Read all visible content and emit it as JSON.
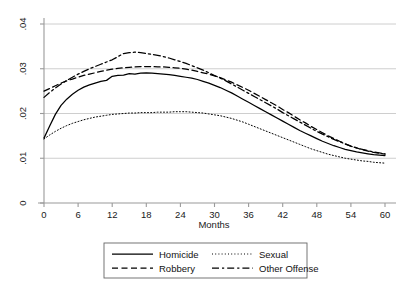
{
  "chart_data": {
    "type": "line",
    "title": "",
    "xlabel": "Months",
    "ylabel": "",
    "xlim": [
      0,
      60
    ],
    "ylim": [
      0,
      0.04
    ],
    "xticks": [
      0,
      6,
      12,
      18,
      24,
      30,
      36,
      42,
      48,
      54,
      60
    ],
    "xtick_labels": [
      "0",
      "6",
      "12",
      "18",
      "24",
      "30",
      "36",
      "42",
      "48",
      "54",
      "60"
    ],
    "yticks": [
      0,
      0.01,
      0.02,
      0.03,
      0.04
    ],
    "ytick_labels": [
      "0",
      ".01",
      ".02",
      ".03",
      ".04"
    ],
    "grid": "horizontal",
    "legend_position": "below-center",
    "x": [
      0,
      1,
      2,
      3,
      4,
      5,
      6,
      7,
      8,
      9,
      10,
      11,
      12,
      13,
      14,
      15,
      16,
      17,
      18,
      19,
      20,
      21,
      22,
      23,
      24,
      25,
      26,
      27,
      28,
      29,
      30,
      31,
      32,
      33,
      34,
      35,
      36,
      37,
      38,
      39,
      40,
      41,
      42,
      43,
      44,
      45,
      46,
      47,
      48,
      49,
      50,
      51,
      52,
      53,
      54,
      55,
      56,
      57,
      58,
      59,
      60
    ],
    "series": [
      {
        "name": "Homicide",
        "style": "solid",
        "values": [
          0.0145,
          0.0172,
          0.0198,
          0.0218,
          0.0232,
          0.0243,
          0.0252,
          0.0259,
          0.0264,
          0.0268,
          0.0272,
          0.0274,
          0.0283,
          0.0285,
          0.0286,
          0.0289,
          0.0288,
          0.029,
          0.0291,
          0.029,
          0.0289,
          0.0288,
          0.0287,
          0.0285,
          0.0283,
          0.0281,
          0.0279,
          0.0276,
          0.0272,
          0.0268,
          0.0263,
          0.0258,
          0.0252,
          0.0246,
          0.0239,
          0.0232,
          0.0225,
          0.0218,
          0.0211,
          0.0204,
          0.0197,
          0.019,
          0.0183,
          0.0176,
          0.0169,
          0.0162,
          0.0156,
          0.015,
          0.0144,
          0.0138,
          0.0133,
          0.0128,
          0.0124,
          0.012,
          0.0117,
          0.0114,
          0.0112,
          0.011,
          0.0108,
          0.0107,
          0.0106
        ]
      },
      {
        "name": "Robbery",
        "style": "dashed",
        "values": [
          0.025,
          0.0256,
          0.0262,
          0.0268,
          0.0273,
          0.0277,
          0.0281,
          0.0285,
          0.0288,
          0.0291,
          0.0294,
          0.0297,
          0.0299,
          0.0301,
          0.0302,
          0.0303,
          0.0304,
          0.0305,
          0.0305,
          0.0305,
          0.0304,
          0.0304,
          0.0303,
          0.0302,
          0.0301,
          0.0299,
          0.0297,
          0.0294,
          0.0291,
          0.0288,
          0.0284,
          0.028,
          0.0275,
          0.027,
          0.0264,
          0.0258,
          0.0252,
          0.0245,
          0.0238,
          0.0231,
          0.0224,
          0.0217,
          0.0209,
          0.0202,
          0.0194,
          0.0186,
          0.0179,
          0.0171,
          0.0164,
          0.0157,
          0.015,
          0.0144,
          0.0138,
          0.0132,
          0.0127,
          0.0123,
          0.0119,
          0.0116,
          0.0113,
          0.0111,
          0.0109
        ]
      },
      {
        "name": "Sexual",
        "style": "dotted",
        "values": [
          0.0143,
          0.0152,
          0.016,
          0.0167,
          0.0173,
          0.0178,
          0.0182,
          0.0186,
          0.0189,
          0.0192,
          0.0194,
          0.0196,
          0.0198,
          0.0199,
          0.02,
          0.0201,
          0.0201,
          0.0202,
          0.0202,
          0.0202,
          0.0203,
          0.0203,
          0.0203,
          0.0204,
          0.0204,
          0.0204,
          0.0203,
          0.0202,
          0.0201,
          0.0199,
          0.0197,
          0.0195,
          0.0192,
          0.0189,
          0.0185,
          0.0181,
          0.0176,
          0.0171,
          0.0166,
          0.0161,
          0.0156,
          0.0151,
          0.0146,
          0.0141,
          0.0136,
          0.0131,
          0.0126,
          0.0121,
          0.0117,
          0.0113,
          0.0109,
          0.0106,
          0.0103,
          0.01,
          0.0098,
          0.0096,
          0.0094,
          0.0093,
          0.0091,
          0.009,
          0.0089
        ]
      },
      {
        "name": "Other Offense",
        "style": "dashdot",
        "values": [
          0.0236,
          0.0247,
          0.0257,
          0.0266,
          0.0274,
          0.0281,
          0.0288,
          0.0294,
          0.03,
          0.0305,
          0.031,
          0.0315,
          0.032,
          0.0327,
          0.0334,
          0.0336,
          0.0337,
          0.0336,
          0.0334,
          0.0332,
          0.033,
          0.0327,
          0.0324,
          0.032,
          0.0316,
          0.0312,
          0.0307,
          0.0302,
          0.0297,
          0.0291,
          0.0285,
          0.0279,
          0.0273,
          0.0266,
          0.0259,
          0.0252,
          0.0245,
          0.0238,
          0.0231,
          0.0224,
          0.0217,
          0.021,
          0.0202,
          0.0195,
          0.0188,
          0.0181,
          0.0174,
          0.0167,
          0.016,
          0.0154,
          0.0148,
          0.0142,
          0.0137,
          0.0132,
          0.0127,
          0.0123,
          0.012,
          0.0117,
          0.0114,
          0.0112,
          0.011
        ]
      }
    ],
    "legend": [
      {
        "label": "Homicide",
        "style": "solid"
      },
      {
        "label": "Sexual",
        "style": "dotted"
      },
      {
        "label": "Robbery",
        "style": "dashed"
      },
      {
        "label": "Other Offense",
        "style": "dashdot"
      }
    ],
    "colors": {
      "line": "#000000",
      "grid": "#c8c8c8",
      "axis": "#9a9a9a",
      "text": "#1a1a1a",
      "background": "#ffffff",
      "legend_border": "#666666"
    }
  }
}
